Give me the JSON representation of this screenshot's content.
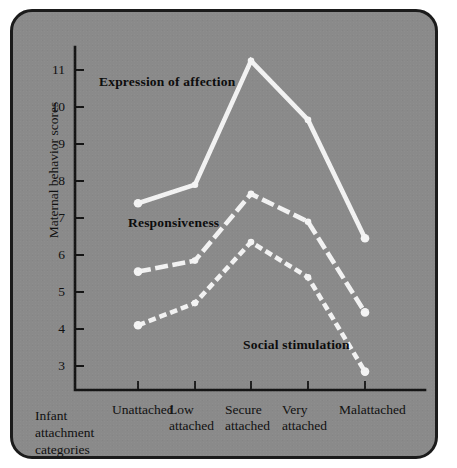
{
  "figure": {
    "background_color": "#8a8a8a",
    "border_color": "#1b1b1b",
    "line_color": "#f2f2f2",
    "text_color": "#111111"
  },
  "axes": {
    "y_title": "Maternal behavior scores",
    "x_title": "Infant\nattachment\ncategories",
    "y_ticks": [
      "11",
      "10",
      "9",
      "8",
      "7",
      "6",
      "5",
      "4",
      "3"
    ],
    "x_tick_labels": [
      "Unattached",
      "Low\nattached",
      "Secure\nattached",
      "Very\nattached",
      "Malattached"
    ]
  },
  "annotations": {
    "affection": "Expression of affection",
    "responsiveness": "Responsiveness",
    "social": "Social stimulation"
  },
  "chart_data": {
    "type": "line",
    "title": "",
    "xlabel": "Infant attachment categories",
    "ylabel": "Maternal behavior scores",
    "categories": [
      "Unattached",
      "Low attached",
      "Secure attached",
      "Very attached",
      "Malattached"
    ],
    "ylim": [
      2.4,
      11.6
    ],
    "yticks": [
      3,
      4,
      5,
      6,
      7,
      8,
      9,
      10,
      11
    ],
    "grid": false,
    "legend": "inline-annotations",
    "series": [
      {
        "name": "Expression of affection",
        "style": "solid",
        "color": "#f2f2f2",
        "values": [
          7.4,
          7.9,
          11.25,
          9.65,
          6.45
        ]
      },
      {
        "name": "Responsiveness",
        "style": "long-dash",
        "color": "#f2f2f2",
        "values": [
          5.55,
          5.85,
          7.65,
          6.9,
          4.45
        ]
      },
      {
        "name": "Social stimulation",
        "style": "short-dash",
        "color": "#f2f2f2",
        "values": [
          4.1,
          4.7,
          6.35,
          5.4,
          2.85
        ]
      }
    ]
  }
}
